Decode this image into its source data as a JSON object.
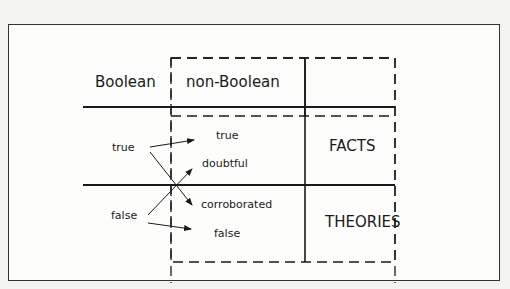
{
  "diagram": {
    "headers": {
      "boolean": "Boolean",
      "non_boolean": "non-Boolean"
    },
    "left_values": {
      "true": "true",
      "false": "false"
    },
    "right_values": {
      "true": "true",
      "doubtful": "doubtful",
      "corroborated": "corroborated",
      "false": "false"
    },
    "rows": {
      "facts": "FACTS",
      "theories": "THEORIES"
    },
    "mappings": [
      {
        "from": "true",
        "to": "true"
      },
      {
        "from": "true",
        "to": "corroborated"
      },
      {
        "from": "false",
        "to": "doubtful"
      },
      {
        "from": "false",
        "to": "false"
      }
    ],
    "colors": {
      "line": "#1a1a1a",
      "background": "#fdfdfb"
    }
  }
}
